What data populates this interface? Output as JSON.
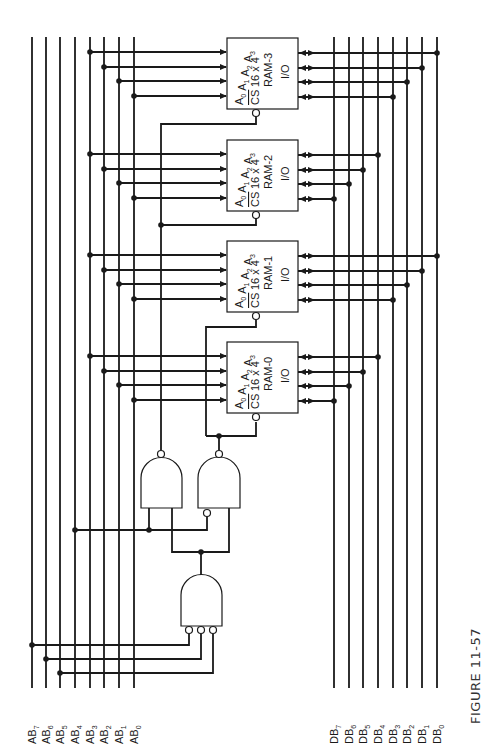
{
  "figure": {
    "caption": "FIGURE 11-57",
    "orientation": "rotated 90° counter-clockwise"
  },
  "address_bus": {
    "lines": [
      {
        "name": "AB",
        "sub": "7",
        "x": 32
      },
      {
        "name": "AB",
        "sub": "6",
        "x": 46
      },
      {
        "name": "AB",
        "sub": "5",
        "x": 60
      },
      {
        "name": "AB",
        "sub": "4",
        "x": 75
      },
      {
        "name": "AB",
        "sub": "3",
        "x": 90
      },
      {
        "name": "AB",
        "sub": "2",
        "x": 104
      },
      {
        "name": "AB",
        "sub": "1",
        "x": 119
      },
      {
        "name": "AB",
        "sub": "0",
        "x": 134
      }
    ]
  },
  "data_bus": {
    "lines": [
      {
        "name": "DB",
        "sub": "7",
        "x": 334
      },
      {
        "name": "DB",
        "sub": "6",
        "x": 349
      },
      {
        "name": "DB",
        "sub": "5",
        "x": 363
      },
      {
        "name": "DB",
        "sub": "4",
        "x": 378
      },
      {
        "name": "DB",
        "sub": "3",
        "x": 393
      },
      {
        "name": "DB",
        "sub": "2",
        "x": 407
      },
      {
        "name": "DB",
        "sub": "1",
        "x": 422
      },
      {
        "name": "DB",
        "sub": "0",
        "x": 437
      }
    ]
  },
  "rams": [
    {
      "name": "RAM-3",
      "size": "16 x 4",
      "io": "I/O",
      "cs": "CS",
      "addr": [
        "A0",
        "A1",
        "A2",
        "A3"
      ],
      "y": 38
    },
    {
      "name": "RAM-2",
      "size": "16 x 4",
      "io": "I/O",
      "cs": "CS",
      "addr": [
        "A0",
        "A1",
        "A2",
        "A3"
      ],
      "y": 140
    },
    {
      "name": "RAM-1",
      "size": "16 x 4",
      "io": "I/O",
      "cs": "CS",
      "addr": [
        "A0",
        "A1",
        "A2",
        "A3"
      ],
      "y": 241
    },
    {
      "name": "RAM-0",
      "size": "16 x 4",
      "io": "I/O",
      "cs": "CS",
      "addr": [
        "A0",
        "A1",
        "A2",
        "A3"
      ],
      "y": 342
    }
  ],
  "data_connections": {
    "RAM-3": [
      "DB0",
      "DB1",
      "DB2",
      "DB3"
    ],
    "RAM-2": [
      "DB4",
      "DB5",
      "DB6",
      "DB7"
    ],
    "RAM-1": [
      "DB0",
      "DB1",
      "DB2",
      "DB3"
    ],
    "RAM-0": [
      "DB4",
      "DB5",
      "DB6",
      "DB7"
    ]
  },
  "gates": [
    {
      "id": "decode-enable",
      "type": "AND",
      "inputs": [
        "AB7 (inverted)",
        "AB6 (inverted)",
        "AB5 (inverted)"
      ]
    },
    {
      "id": "select-upper",
      "type": "NAND",
      "inputs": [
        "AB4",
        "enable"
      ],
      "drives": [
        "RAM-3 CS",
        "RAM-2 CS"
      ]
    },
    {
      "id": "select-lower",
      "type": "NAND",
      "inputs": [
        "AB4 (inverted)",
        "enable"
      ],
      "drives": [
        "RAM-1 CS",
        "RAM-0 CS"
      ]
    }
  ]
}
